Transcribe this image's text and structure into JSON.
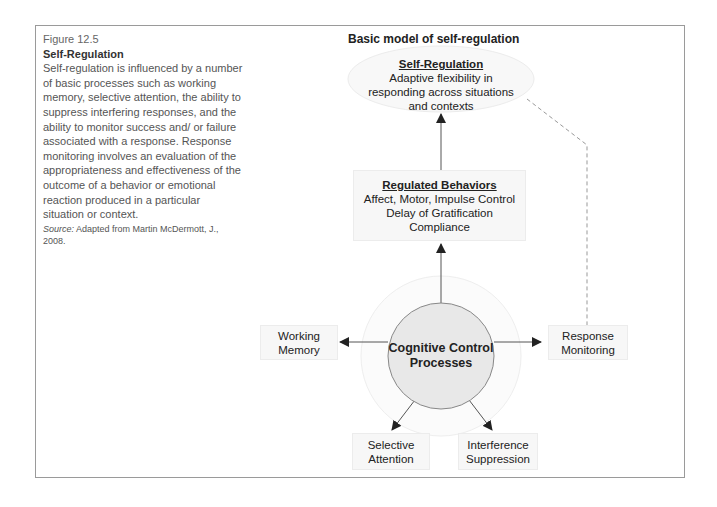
{
  "caption": {
    "figure_number": "Figure 12.5",
    "title": "Self-Regulation",
    "body": "Self-regulation is influenced by a number of basic processes such as working memory, selective attention, the ability to suppress interfering responses, and the ability to monitor success and/ or failure associated with a response. Response monitoring involves an evaluation of the appropriateness and effectiveness of the outcome of a behavior or emotional reaction produced in a particular situation or context.",
    "source_label": "Source:",
    "source_text": "Adapted from Martin McDermott, J., 2008."
  },
  "diagram": {
    "title": "Basic model of self-regulation",
    "top_node": {
      "heading": "Self-Regulation",
      "line1": "Adaptive flexibility in",
      "line2": "responding across situations",
      "line3": "and contexts"
    },
    "middle_node": {
      "heading": "Regulated Behaviors",
      "line1": "Affect, Motor, Impulse Control",
      "line2": "Delay of Gratification",
      "line3": "Compliance"
    },
    "core_node": {
      "line1": "Cognitive Control",
      "line2": "Processes"
    },
    "left_node": {
      "line1": "Working",
      "line2": "Memory"
    },
    "right_node": {
      "line1": "Response",
      "line2": "Monitoring"
    },
    "bottom_left_node": {
      "line1": "Selective",
      "line2": "Attention"
    },
    "bottom_right_node": {
      "line1": "Interference",
      "line2": "Suppression"
    },
    "colors": {
      "frame": "#9a9a9a",
      "node_fill": "#f7f7f7",
      "core_fill": "#e8e8e8",
      "arrow": "#222222",
      "dashed": "#999999"
    }
  }
}
